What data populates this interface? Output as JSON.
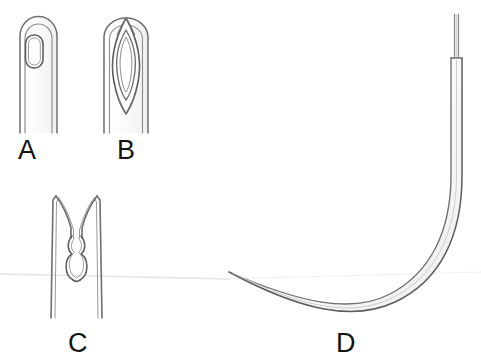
{
  "figure": {
    "background_color": "#ffffff",
    "line_color": "#6b6b6b",
    "line_color_dark": "#4a4a4a",
    "label_color": "#141414",
    "width": 481,
    "height": 361
  },
  "panels": [
    {
      "id": "a",
      "label": "A",
      "description": "Straight needle shaft with closed rounded-rectangle eye",
      "eye_type": "closed round eye"
    },
    {
      "id": "b",
      "label": "B",
      "description": "Straight needle shaft with pointed-oval French eye",
      "eye_type": "french eye"
    },
    {
      "id": "c",
      "label": "C",
      "description": "Straight needle shaft with split spring eye and two round openings",
      "eye_type": "spring eye"
    },
    {
      "id": "d",
      "label": "D",
      "description": "Half-curved J-shaped needle with swaged suture thread",
      "eye_type": "swaged"
    }
  ]
}
